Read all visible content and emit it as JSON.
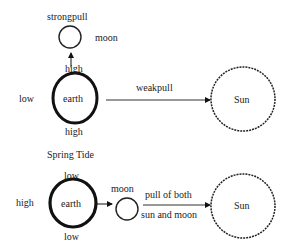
{
  "neap": {
    "strong_pull_label": "strongpull",
    "moon_label": "moon",
    "earth_label": "earth",
    "high_top_label": "high",
    "high_bottom_label": "high",
    "low_left_label": "low",
    "weak_pull_label": "weakpull",
    "sun_label": "Sun"
  },
  "spring": {
    "title": "Spring Tide",
    "low_top_label": "low",
    "low_bottom_label": "low",
    "high_left_label": "high",
    "earth_label": "earth",
    "moon_label": "moon",
    "pull_label_line1": "pull of both",
    "pull_label_line2": "sun and moon",
    "sun_label": "Sun"
  }
}
